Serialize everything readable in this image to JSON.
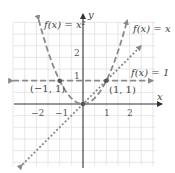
{
  "chart_data": {
    "type": "line",
    "title": "",
    "xlabel": "x",
    "ylabel": "y",
    "xlim": [
      -3,
      3
    ],
    "ylim": [
      -2.7,
      3.5
    ],
    "grid": true,
    "grid_step": 0.5,
    "x_ticks": [
      {
        "value": -2,
        "label": "−2"
      },
      {
        "value": -1,
        "label": "−1"
      },
      {
        "value": 1,
        "label": "1"
      },
      {
        "value": 2,
        "label": "2"
      }
    ],
    "y_ticks": [
      {
        "value": 1,
        "label": "1"
      },
      {
        "value": 2,
        "label": "2"
      }
    ],
    "series": [
      {
        "name": "f(x) = x²",
        "style": "dashed",
        "color": "#8a8a8a",
        "expression": "x^2",
        "x_range": [
          -1.9,
          1.9
        ]
      },
      {
        "name": "f(x) = x",
        "style": "dotted",
        "color": "#8a8a8a",
        "expression": "x",
        "x_range": [
          -2.6,
          2.5
        ]
      },
      {
        "name": "f(x) = 1",
        "style": "dashed",
        "color": "#8a8a8a",
        "expression": "1",
        "x_range": [
          -3.0,
          3.0
        ]
      }
    ],
    "points": [
      {
        "x": -1,
        "y": 1,
        "label": "(−1, 1)"
      },
      {
        "x": 1,
        "y": 1,
        "label": "(1, 1)"
      },
      {
        "x": 0,
        "y": 0,
        "label": ""
      }
    ],
    "annotations": [
      {
        "text": "f(x) = x²",
        "near": "top-left of parabola"
      },
      {
        "text": "f(x) = x",
        "near": "top-right of line y=x"
      },
      {
        "text": "f(x) = 1",
        "near": "right end of horizontal line"
      }
    ]
  },
  "labels": {
    "x_axis": "x",
    "y_axis": "y",
    "parabola": "f(x) = x²",
    "identity": "f(x) = x",
    "constant": "f(x) = 1",
    "point_left": "(−1, 1)",
    "point_right": "(1, 1)",
    "tick_x_m2": "−2",
    "tick_x_m1": "−1",
    "tick_x_1": "1",
    "tick_x_2": "2",
    "tick_y_1": "1",
    "tick_y_2": "2"
  }
}
